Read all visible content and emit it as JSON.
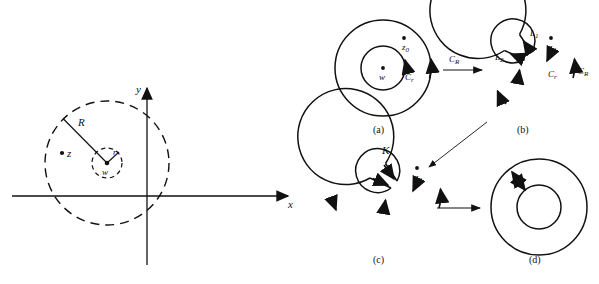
{
  "figure": {
    "stroke_color": "#111111",
    "background": "#ffffff"
  },
  "left_panel": {
    "name": "annulus-with-axes",
    "axes": {
      "x_label": "x",
      "y_label": "y"
    },
    "labels": {
      "outer_radius": "R",
      "inner_radius": "r",
      "point_z": "z",
      "center_w": "w"
    },
    "geometry": {
      "center_x": 107,
      "center_y": 163,
      "outer_radius_px": 62,
      "inner_radius_px": 15,
      "origin_x": 147,
      "origin_y": 196,
      "outer_dashed": true,
      "inner_dashed": true
    }
  },
  "right_panel": {
    "name": "contour-deformation-sequence",
    "panels": [
      {
        "id": "a",
        "caption": "(a)",
        "labels": [
          "z_0",
          "w",
          "C_r",
          "C_R"
        ],
        "label_text": {
          "z0": "z",
          "z0_sub": "0",
          "w": "w",
          "Cr": "C",
          "Cr_sub": "r",
          "CR": "C",
          "CR_sub": "R"
        }
      },
      {
        "id": "b",
        "caption": "(b)",
        "labels": [
          "L_1",
          "L_2",
          "z_0",
          "C_r",
          "C_R"
        ],
        "label_text": {
          "L1": "L",
          "L1_sub": "1",
          "L2": "L",
          "L2_sub": "2",
          "z0": "z",
          "z0_sub": "0",
          "Cr": "C",
          "Cr_sub": "r",
          "CR": "C",
          "CR_sub": "R"
        }
      },
      {
        "id": "c",
        "caption": "(c)",
        "labels": [
          "K",
          "z_0"
        ],
        "label_text": {
          "K": "K",
          "z0": "z",
          "z0_sub": "0"
        }
      },
      {
        "id": "d",
        "caption": "(d)",
        "labels": [],
        "label_text": {}
      }
    ],
    "transition_labels": {
      "a_to_b": "C",
      "a_to_b_sub": "R"
    }
  }
}
